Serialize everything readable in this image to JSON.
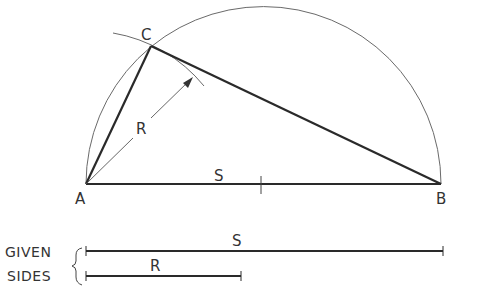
{
  "diagram": {
    "points": {
      "A": {
        "label": "A",
        "x": 86,
        "y": 184
      },
      "B": {
        "label": "B",
        "x": 441,
        "y": 184
      },
      "C": {
        "label": "C",
        "x": 151,
        "y": 46
      },
      "midpoint": {
        "x": 263,
        "y": 184
      }
    },
    "labels": {
      "point_a": "A",
      "point_b": "B",
      "point_c": "C",
      "radius": "R",
      "base": "S"
    },
    "given_sides": {
      "caption_line1": "GIVEN",
      "caption_line2": "SIDES",
      "side_s_label": "S",
      "side_r_label": "R"
    },
    "colors": {
      "heavy_line": "#2a2a2a",
      "thin_line": "#6a6a6a",
      "text": "#333333",
      "background": "#ffffff"
    }
  }
}
